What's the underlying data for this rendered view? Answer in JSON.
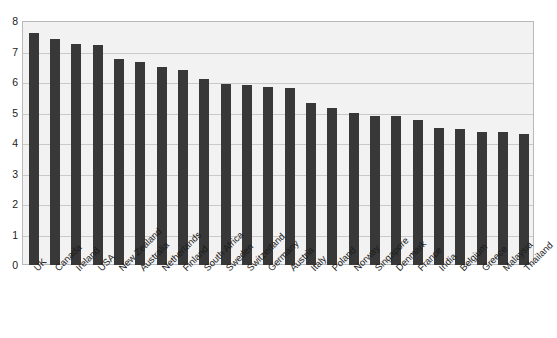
{
  "chart_data": {
    "type": "bar",
    "title": "",
    "subtitle": "",
    "xlabel": "",
    "ylabel": "",
    "ylim": [
      0,
      8
    ],
    "ytick_labels": [
      "8",
      "7",
      "6",
      "5",
      "4",
      "3",
      "2",
      "1",
      "0"
    ],
    "ytick_values": [
      8,
      7,
      6,
      5,
      4,
      3,
      2,
      1,
      0
    ],
    "grid": true,
    "legend": null,
    "bar_color": "#383838",
    "plot_background": "#f2f2f2",
    "categories": [
      "UK",
      "Canada",
      "Ireland",
      "USA",
      "New Zealand",
      "Australia",
      "Netherlands",
      "Finland",
      "South Africa",
      "Sweden",
      "Switzerland",
      "Germany",
      "Austria",
      "Italy",
      "Poland",
      "Norway",
      "Singapore",
      "Denmark",
      "France",
      "India",
      "Belgium",
      "Greece",
      "Malaysia",
      "Thailand"
    ],
    "values": [
      7.6,
      7.4,
      7.25,
      7.2,
      6.75,
      6.65,
      6.5,
      6.4,
      6.1,
      5.95,
      5.9,
      5.85,
      5.8,
      5.3,
      5.15,
      5.0,
      4.9,
      4.9,
      4.75,
      4.5,
      4.45,
      4.35,
      4.35,
      4.3
    ]
  }
}
